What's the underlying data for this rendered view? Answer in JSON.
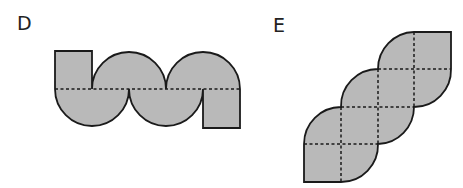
{
  "figures": [
    {
      "id": "D",
      "label": "D",
      "description": "Strip of alternating semicircles with end squares, dashed midline"
    },
    {
      "id": "E",
      "label": "E",
      "description": "Diagonal staircase of leaf shapes on a dashed grid"
    }
  ],
  "colors": {
    "fill": "#b9b9b9",
    "stroke": "#1a1a1a",
    "background": "#ffffff"
  }
}
